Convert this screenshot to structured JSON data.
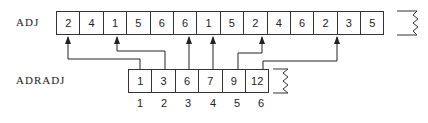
{
  "adj": {
    "label": "ADJ",
    "cells": [
      "2",
      "4",
      "1",
      "5",
      "6",
      "6",
      "1",
      "5",
      "2",
      "4",
      "6",
      "2",
      "3",
      "5"
    ],
    "continues": true
  },
  "adradj": {
    "label": "ADRADJ",
    "cells": [
      "1",
      "3",
      "6",
      "7",
      "9",
      "12"
    ],
    "indices": [
      "1",
      "2",
      "3",
      "4",
      "5",
      "6"
    ],
    "continues": true
  },
  "pointers": [
    {
      "from_index": 1,
      "to_adj_position": 1
    },
    {
      "from_index": 2,
      "to_adj_position": 3
    },
    {
      "from_index": 3,
      "to_adj_position": 6
    },
    {
      "from_index": 4,
      "to_adj_position": 7
    },
    {
      "from_index": 5,
      "to_adj_position": 9
    },
    {
      "from_index": 6,
      "to_adj_position": 12
    }
  ]
}
